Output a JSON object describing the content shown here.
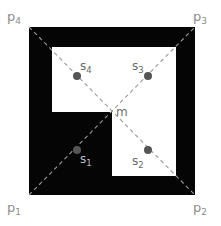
{
  "figure": {
    "background_color": "#ffffff",
    "shape_fill_color": "#050505",
    "hole_fill_color": "#ffffff",
    "diagonal_color": "#9a9a9a",
    "dot_color": "#555555"
  },
  "corner_points": [
    {
      "id": "p1",
      "base": "p",
      "sub": "1",
      "label": "p₁",
      "x": 29,
      "y": 195,
      "label_x": 7,
      "label_y": 201,
      "color": "#8d8d8d"
    },
    {
      "id": "p2",
      "base": "p",
      "sub": "2",
      "label": "p₂",
      "x": 195,
      "y": 195,
      "label_x": 193,
      "label_y": 201,
      "color": "#8d8d8d"
    },
    {
      "id": "p3",
      "base": "p",
      "sub": "3",
      "label": "p₃",
      "x": 195,
      "y": 27,
      "label_x": 193,
      "label_y": 10,
      "color": "#8d8d8d"
    },
    {
      "id": "p4",
      "base": "p",
      "sub": "4",
      "label": "p₄",
      "x": 29,
      "y": 27,
      "label_x": 7,
      "label_y": 10,
      "color": "#8d8d8d"
    }
  ],
  "site_points": [
    {
      "id": "s1",
      "base": "s",
      "sub": "1",
      "label": "s₁",
      "x": 77,
      "y": 150,
      "label_x": 80,
      "label_y": 153,
      "on": "black"
    },
    {
      "id": "s2",
      "base": "s",
      "sub": "2",
      "label": "s₂",
      "x": 148,
      "y": 150,
      "label_x": 132,
      "label_y": 155,
      "on": "white"
    },
    {
      "id": "s3",
      "base": "s",
      "sub": "3",
      "label": "s₃",
      "x": 148,
      "y": 76,
      "label_x": 132,
      "label_y": 60,
      "on": "white"
    },
    {
      "id": "s4",
      "base": "s",
      "sub": "4",
      "label": "s₄",
      "x": 77,
      "y": 76,
      "label_x": 80,
      "label_y": 60,
      "on": "white"
    }
  ],
  "center_point": {
    "id": "m",
    "label": "m",
    "x": 112,
    "y": 112,
    "label_x": 116,
    "label_y": 106
  },
  "outer_square": {
    "x": 29,
    "y": 27,
    "width": 166,
    "height": 168
  },
  "holes": [
    {
      "id": "upper-hole",
      "x": 52,
      "y": 47,
      "width": 124,
      "height": 65
    },
    {
      "id": "lower-hole",
      "x": 112,
      "y": 112,
      "width": 64,
      "height": 64
    }
  ],
  "diagonals": [
    {
      "id": "diagonal-p1-p3",
      "x1": 29,
      "y1": 195,
      "x2": 195,
      "y2": 27
    },
    {
      "id": "diagonal-p4-p2",
      "x1": 29,
      "y1": 27,
      "x2": 195,
      "y2": 195
    }
  ]
}
